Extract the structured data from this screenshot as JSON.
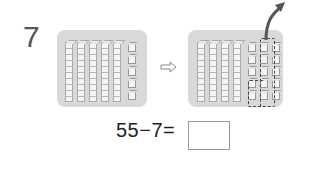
{
  "problem": {
    "number": "7",
    "equation": "55−7=",
    "answer": ""
  },
  "left_model": {
    "tens_rods": 5,
    "unit_cubes": 5,
    "value": 55
  },
  "right_model": {
    "tens_rods": 4,
    "unit_cubes": 15,
    "removed_cubes": 7,
    "value_after": 48
  },
  "icons": {
    "transform_arrow": "right-arrow-icon",
    "remove_arrow": "curved-up-arrow-icon"
  },
  "colors": {
    "panel": "#d9d9d9",
    "number": "#555555",
    "arrow": "#444444"
  }
}
